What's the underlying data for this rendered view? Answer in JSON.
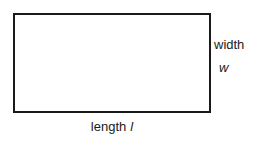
{
  "figure": {
    "type": "rectangle-dimension-diagram",
    "shape_name": "rectangle",
    "stroke_color": "#1a1a1a",
    "fill_color": "#ffffff",
    "background_color": "#ffffff"
  },
  "labels": {
    "width": {
      "word": "width",
      "variable": "w"
    },
    "length": {
      "word": "length",
      "variable": "l"
    }
  }
}
